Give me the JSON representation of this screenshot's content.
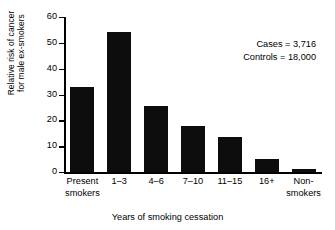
{
  "chart_data": {
    "type": "bar",
    "title": "",
    "xlabel": "Years of smoking cessation",
    "ylabel": "Relative risk of cancer for male ex-smokers",
    "ylabel_lines": [
      "Relative risk of cancer",
      "for male ex-smokers"
    ],
    "categories": [
      "Present smokers",
      "1–3",
      "4–6",
      "7–10",
      "11–15",
      "16+",
      "Non-smokers"
    ],
    "category_lines": [
      [
        "Present",
        "smokers"
      ],
      [
        "1–3"
      ],
      [
        "4–6"
      ],
      [
        "7–10"
      ],
      [
        "11–15"
      ],
      [
        "16+"
      ],
      [
        "Non-",
        "smokers"
      ]
    ],
    "values": [
      33,
      54.3,
      25.5,
      18,
      13.5,
      5,
      1
    ],
    "ylim": [
      0,
      60
    ],
    "yticks": [
      0,
      10,
      20,
      30,
      40,
      50,
      60
    ],
    "ytick_labels": [
      "0",
      "10",
      "20",
      "30",
      "40",
      "50",
      "60"
    ],
    "grid": false,
    "legend": "none",
    "bar_color": "#0d0d0d",
    "annotations": [
      "Cases = 3,716",
      "Controls = 18,000"
    ]
  }
}
